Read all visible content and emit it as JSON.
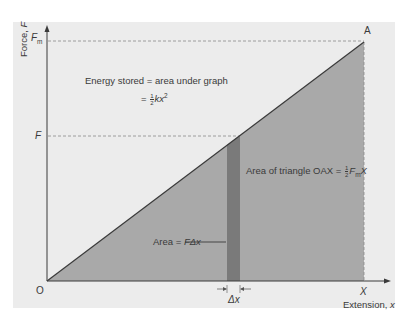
{
  "diagram": {
    "type": "force-extension graph",
    "colors": {
      "panel_bg": "#ececec",
      "triangle_fill": "#a9a9a9",
      "strip_fill": "#7a7a7a",
      "line": "#3a3a3a",
      "dashed": "#8a8a8a"
    },
    "axes": {
      "y_label_main": "Force, ",
      "y_label_var": "F",
      "x_label_main": "Extension, ",
      "x_label_var": "x",
      "origin": "O"
    },
    "points": {
      "A": "A",
      "Fm_main": "F",
      "Fm_sub": "m",
      "F": "F",
      "X": "X"
    },
    "annotations": {
      "energy_line1": "Energy stored = area under graph",
      "energy_eq_prefix": "= ",
      "half_num": "1",
      "half_den": "2",
      "energy_eq_var": "kx",
      "energy_eq_exp": "2",
      "triangle_prefix": "Area of triangle OAX = ",
      "triangle_F": "F",
      "triangle_sub": "m",
      "triangle_X": "X",
      "strip_prefix": "Area = ",
      "strip_var": "FΔx",
      "delta_x": "Δx"
    }
  }
}
